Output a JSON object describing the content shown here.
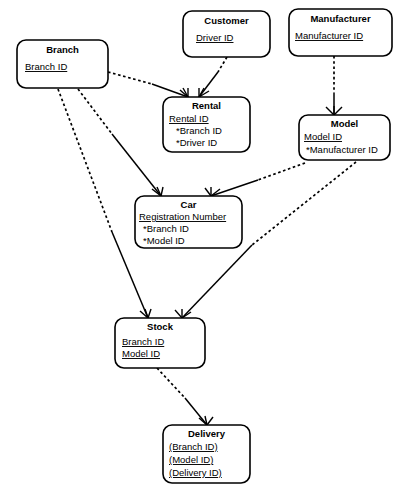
{
  "diagram": {
    "type": "entity-relationship-diagram",
    "notation": "crow's foot",
    "background_color": "#ffffff",
    "line_color": "#000000",
    "entities": [
      {
        "id": "branch",
        "name": "Branch",
        "attributes": [
          {
            "text": "Branch ID",
            "underlined": true,
            "foreign_key": false
          }
        ]
      },
      {
        "id": "customer",
        "name": "Customer",
        "attributes": [
          {
            "text": "Driver ID",
            "underlined": true,
            "foreign_key": false
          }
        ]
      },
      {
        "id": "manufacturer",
        "name": "Manufacturer",
        "attributes": [
          {
            "text": "Manufacturer ID",
            "underlined": true,
            "foreign_key": false
          }
        ]
      },
      {
        "id": "rental",
        "name": "Rental",
        "attributes": [
          {
            "text": "Rental ID",
            "underlined": true,
            "foreign_key": false
          },
          {
            "text": "*Branch ID",
            "underlined": false,
            "foreign_key": true
          },
          {
            "text": "*Driver ID",
            "underlined": false,
            "foreign_key": true
          }
        ]
      },
      {
        "id": "model",
        "name": "Model",
        "attributes": [
          {
            "text": "Model ID",
            "underlined": true,
            "foreign_key": false
          },
          {
            "text": "*Manufacturer ID",
            "underlined": false,
            "foreign_key": true
          }
        ]
      },
      {
        "id": "car",
        "name": "Car",
        "attributes": [
          {
            "text": "Registration Number",
            "underlined": true,
            "foreign_key": false
          },
          {
            "text": "*Branch ID",
            "underlined": false,
            "foreign_key": true
          },
          {
            "text": "*Model ID",
            "underlined": false,
            "foreign_key": true
          }
        ]
      },
      {
        "id": "stock",
        "name": "Stock",
        "attributes": [
          {
            "text": "Branch ID",
            "underlined": true,
            "foreign_key": false
          },
          {
            "text": "Model ID",
            "underlined": true,
            "foreign_key": false
          }
        ]
      },
      {
        "id": "delivery",
        "name": "Delivery",
        "attributes": [
          {
            "text": "(Branch ID)",
            "underlined": true,
            "foreign_key": false
          },
          {
            "text": "(Model ID)",
            "underlined": true,
            "foreign_key": false
          },
          {
            "text": "(Delivery ID)",
            "underlined": true,
            "foreign_key": false
          }
        ]
      }
    ],
    "relationships": [
      {
        "id": "branch-rental",
        "from": "branch",
        "to": "rental",
        "many_end": "rental"
      },
      {
        "id": "customer-rental",
        "from": "customer",
        "to": "rental",
        "many_end": "rental"
      },
      {
        "id": "manufacturer-model",
        "from": "manufacturer",
        "to": "model",
        "many_end": "model"
      },
      {
        "id": "branch-car",
        "from": "branch",
        "to": "car",
        "many_end": "car"
      },
      {
        "id": "model-car",
        "from": "model",
        "to": "car",
        "many_end": "car"
      },
      {
        "id": "branch-stock",
        "from": "branch",
        "to": "stock",
        "many_end": "stock"
      },
      {
        "id": "model-stock",
        "from": "model",
        "to": "stock",
        "many_end": "stock"
      },
      {
        "id": "stock-delivery",
        "from": "stock",
        "to": "delivery",
        "many_end": "delivery"
      }
    ]
  }
}
